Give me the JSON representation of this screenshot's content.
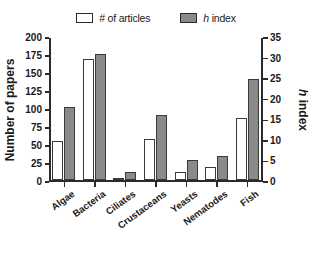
{
  "chart_data": {
    "type": "bar",
    "title": "",
    "subtitle": "",
    "categories": [
      "Algae",
      "Bacteria",
      "Ciliates",
      "Crustaceans",
      "Yeasts",
      "Nematodes",
      "Fish"
    ],
    "series": [
      {
        "name": "# of articles",
        "axis": "left",
        "style": "open",
        "color": "#ffffff",
        "edge_color": "#3a3a3a",
        "values": [
          55,
          170,
          2,
          58,
          12,
          19,
          87
        ]
      },
      {
        "name": "h index",
        "axis": "right",
        "style": "filled",
        "color": "#8a8a8a",
        "edge_color": "#3a3a3a",
        "values": [
          18,
          31,
          2,
          16,
          5,
          6,
          25
        ]
      }
    ],
    "xlabel": "",
    "ylabel": "Number of papers",
    "ylabel_right": "h index",
    "ylim": [
      0,
      200
    ],
    "ylim_right": [
      0,
      35
    ],
    "yticks": [
      0,
      25,
      50,
      75,
      100,
      125,
      150,
      175,
      200
    ],
    "yticks_right": [
      0,
      5,
      10,
      15,
      20,
      25,
      30,
      35
    ],
    "grid": false,
    "legend_position": "top-center",
    "xtick_rotation": -36
  },
  "legend": {
    "entries": [
      {
        "label": "# of articles",
        "italic_prefix": "",
        "swatch": "open-square-swatch"
      },
      {
        "label": " index",
        "italic_prefix": "h",
        "swatch": "filled-square-swatch"
      }
    ]
  },
  "axes": {
    "left_title": "Number of papers",
    "right_title_italic": "h",
    "right_title_rest": " index"
  }
}
